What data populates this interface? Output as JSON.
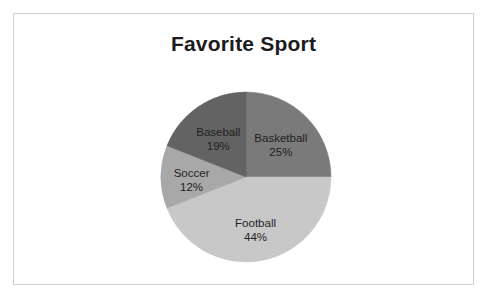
{
  "chart_data": {
    "type": "pie",
    "title": "Favorite Sport",
    "categories": [
      "Basketball",
      "Football",
      "Soccer",
      "Baseball"
    ],
    "values": [
      25,
      44,
      12,
      19
    ],
    "value_suffix": "%",
    "labels": [
      "Basketball",
      "Football",
      "Soccer",
      "Baseball"
    ],
    "value_labels": [
      "25%",
      "44%",
      "12%",
      "19%"
    ],
    "colors": [
      "#7a7a7a",
      "#c8c8c8",
      "#a8a8a8",
      "#636363"
    ],
    "start_angle_deg": 0,
    "direction": "clockwise",
    "legend": "none",
    "labels_position": "inside-slices",
    "grid": false,
    "slices": [
      {
        "label": "Basketball",
        "value": 25,
        "value_label": "25%",
        "color": "#7a7a7a"
      },
      {
        "label": "Football",
        "value": 44,
        "value_label": "44%",
        "color": "#c8c8c8"
      },
      {
        "label": "Soccer",
        "value": 12,
        "value_label": "12%",
        "color": "#a8a8a8"
      },
      {
        "label": "Baseball",
        "value": 19,
        "value_label": "19%",
        "color": "#636363"
      }
    ]
  },
  "card": {
    "border_color": "#d0d0d0",
    "background": "#ffffff"
  },
  "title": {
    "text": "Favorite Sport",
    "color": "#1c1c1c"
  }
}
